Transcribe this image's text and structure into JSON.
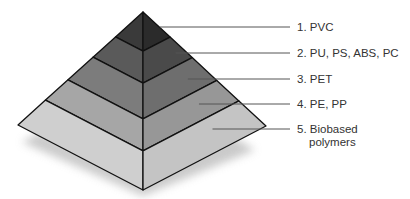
{
  "diagram": {
    "type": "pyramid",
    "title": "",
    "tiers": [
      {
        "rank": 1,
        "label": "1. PVC",
        "lines": [
          "1. PVC"
        ],
        "color_left": "#3a3a3a",
        "color_right": "#2b2b2b"
      },
      {
        "rank": 2,
        "label": "2. PU, PS, ABS, PC",
        "lines": [
          "2. PU, PS, ABS, PC"
        ],
        "color_left": "#5a5a5a",
        "color_right": "#4a4a4a"
      },
      {
        "rank": 3,
        "label": "3. PET",
        "lines": [
          "3. PET"
        ],
        "color_left": "#7c7c7c",
        "color_right": "#6e6e6e"
      },
      {
        "rank": 4,
        "label": "4. PE, PP",
        "lines": [
          "4. PE, PP"
        ],
        "color_left": "#a6a6a6",
        "color_right": "#979797"
      },
      {
        "rank": 5,
        "label": "5. Biobased polymers",
        "lines": [
          "5. Biobased",
          "polymers"
        ],
        "color_left": "#cfcfcf",
        "color_right": "#c4c4c4"
      }
    ],
    "colors": {
      "outline": "#111111",
      "leader": "#555555",
      "shadow": "#bdbdbd",
      "text": "#333333"
    }
  }
}
